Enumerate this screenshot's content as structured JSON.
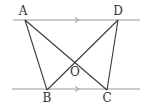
{
  "diagram": {
    "type": "geometry",
    "colors": {
      "parallel_lines": "#9a9a9a",
      "segments": "#3a3a3a",
      "arrow": "#9a9a9a",
      "labels": "#333333"
    },
    "points": {
      "A": {
        "label": "A",
        "x": 25,
        "y": 20,
        "label_x": 23,
        "label_y": 11
      },
      "D": {
        "label": "D",
        "x": 118,
        "y": 20,
        "label_x": 118,
        "label_y": 11
      },
      "B": {
        "label": "B",
        "x": 47,
        "y": 90,
        "label_x": 47,
        "label_y": 98
      },
      "C": {
        "label": "C",
        "x": 107,
        "y": 90,
        "label_x": 107,
        "label_y": 98
      },
      "O": {
        "label": "O",
        "x": 76,
        "y": 61,
        "label_x": 75,
        "label_y": 72
      }
    },
    "parallel_lines": [
      {
        "name": "top-line",
        "x1": 13,
        "y1": 20,
        "x2": 140,
        "y2": 20,
        "arrow_x": 78
      },
      {
        "name": "bottom-line",
        "x1": 12,
        "y1": 89,
        "x2": 140,
        "y2": 89,
        "arrow_x": 78
      }
    ],
    "segments": [
      {
        "name": "AB",
        "from": "A",
        "to": "B"
      },
      {
        "name": "AC",
        "from": "A",
        "to": "C"
      },
      {
        "name": "DB",
        "from": "D",
        "to": "B"
      },
      {
        "name": "DC",
        "from": "D",
        "to": "C"
      }
    ]
  }
}
